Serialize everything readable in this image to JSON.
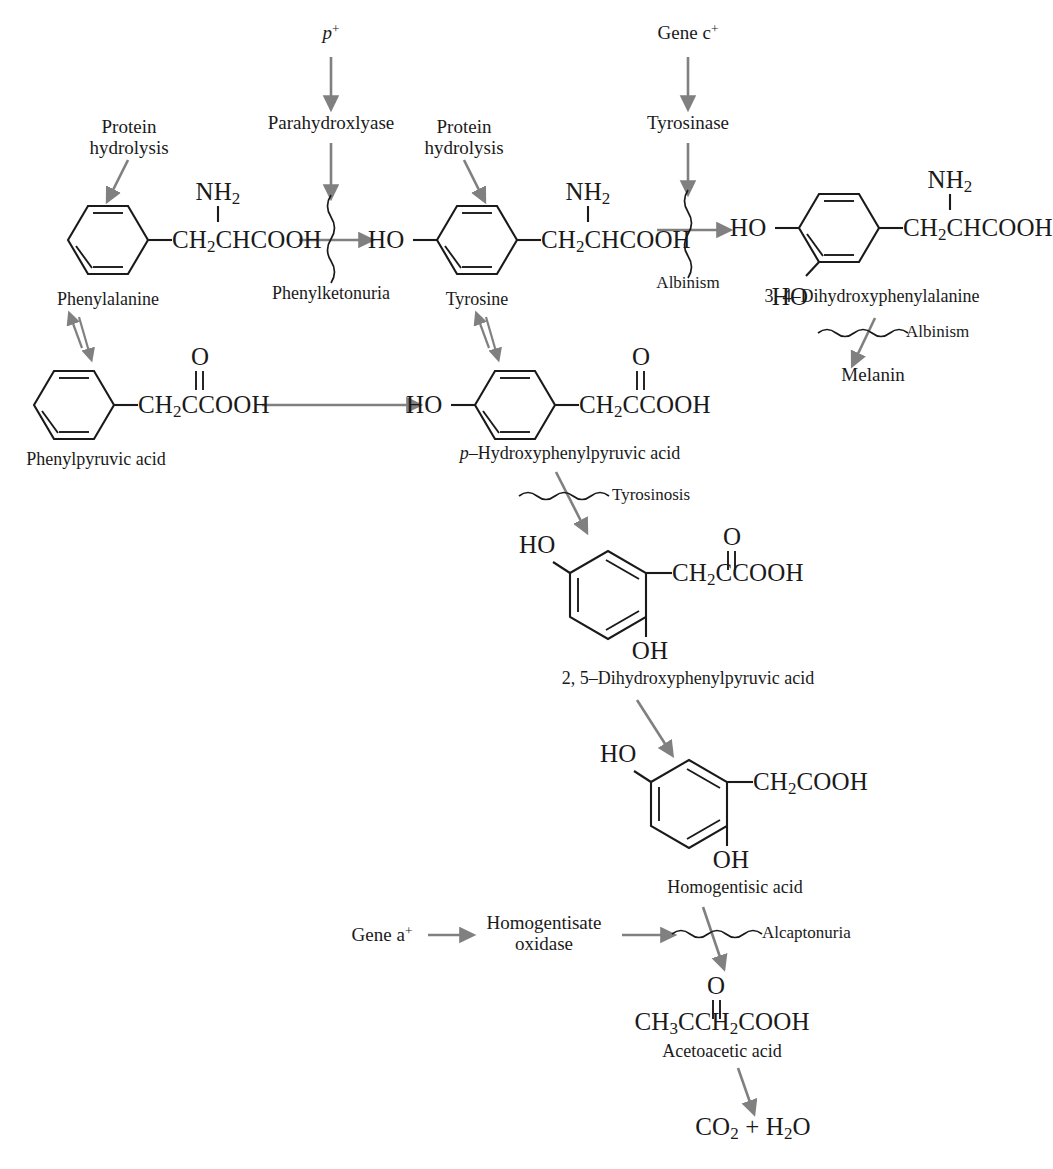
{
  "diagram": {
    "accent_arrow_color": "#808080",
    "structure_color": "#1a1a1a",
    "background_color": "#ffffff"
  },
  "genes": {
    "p_plus": "p",
    "p_plus_sup": "+",
    "gene_c": "Gene c",
    "gene_c_sup": "+",
    "gene_a": "Gene a",
    "gene_a_sup": "+"
  },
  "enzymes": {
    "parahydroxylase": "Parahydroxlyase",
    "tyrosinase": "Tyrosinase",
    "homogentisate_oxidase_line1": "Homogentisate",
    "homogentisate_oxidase_line2": "oxidase"
  },
  "inputs": {
    "protein_hydrolysis_1_line1": "Protein",
    "protein_hydrolysis_1_line2": "hydrolysis",
    "protein_hydrolysis_2_line1": "Protein",
    "protein_hydrolysis_2_line2": "hydrolysis"
  },
  "diseases": {
    "phenylketonuria": "Phenylketonuria",
    "albinism_dopa": "Albinism",
    "albinism_melanin": "Albinism",
    "tyrosinosis": "Tyrosinosis",
    "alcaptonuria": "Alcaptonuria"
  },
  "compounds": {
    "phenylalanine": {
      "name": "Phenylalanine",
      "side_chain": "CH",
      "side_chain_sub": "2",
      "side_chain_rest": "CHCOOH",
      "amine": "NH",
      "amine_sub": "2"
    },
    "tyrosine": {
      "name": "Tyrosine",
      "hydroxyl": "HO",
      "side_chain": "CH",
      "side_chain_sub": "2",
      "side_chain_rest": "CHCOOH",
      "amine": "NH",
      "amine_sub": "2"
    },
    "dopa": {
      "name": "3, 4–Dihydroxyphenylalanine",
      "hydroxyl_left": "HO",
      "hydroxyl_lower": "HO",
      "side_chain": "CH",
      "side_chain_sub": "2",
      "side_chain_rest": "CHCOOH",
      "amine": "NH",
      "amine_sub": "2"
    },
    "melanin": {
      "name": "Melanin"
    },
    "phenylpyruvic_acid": {
      "name": "Phenylpyruvic acid",
      "side_chain": "CH",
      "side_chain_sub": "2",
      "side_chain_rest": "CCOOH",
      "carbonyl_o": "O"
    },
    "p_hydroxyphenylpyruvic_acid": {
      "name_italic": "p",
      "name_rest": "–Hydroxyphenylpyruvic acid",
      "hydroxyl": "HO",
      "side_chain": "CH",
      "side_chain_sub": "2",
      "side_chain_rest": "CCOOH",
      "carbonyl_o": "O"
    },
    "dihydroxyphenylpyruvic_acid": {
      "name": "2, 5–Dihydroxyphenylpyruvic acid",
      "hydroxyl_top": "HO",
      "hydroxyl_bottom": "OH",
      "side_chain": "CH",
      "side_chain_sub": "2",
      "side_chain_rest": "CCOOH",
      "carbonyl_o": "O"
    },
    "homogentisic_acid": {
      "name": "Homogentisic acid",
      "hydroxyl_top": "HO",
      "hydroxyl_bottom": "OH",
      "side_chain": "CH",
      "side_chain_sub": "2",
      "side_chain_rest": "COOH"
    },
    "acetoacetic_acid": {
      "name": "Acetoacetic acid",
      "formula_a": "CH",
      "formula_a_sub": "3",
      "formula_b": "CCH",
      "formula_b_sub": "2",
      "formula_c": "COOH",
      "carbonyl_o": "O"
    },
    "final_products": {
      "co2": "CO",
      "co2_sub": "2",
      "plus": " + ",
      "h2o": "H",
      "h2o_sub": "2",
      "h2o_rest": "O"
    }
  }
}
